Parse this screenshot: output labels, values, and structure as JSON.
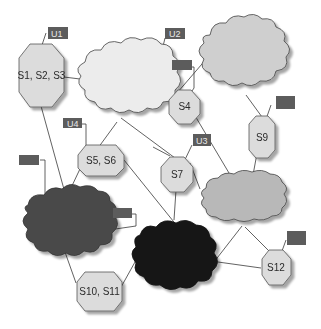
{
  "diagram": {
    "colors": {
      "background": "#ffffff",
      "octagon_fill": "#dcdcdc",
      "octagon_stroke": "#555555",
      "tag_fill": "#5c5c5c",
      "line": "#3a3a3a",
      "cloud_light": "#ececec",
      "cloud_midlight": "#cfcfcf",
      "cloud_mid": "#b8b8b8",
      "cloud_dark": "#4a4a4a",
      "cloud_black": "#151515"
    },
    "nodes": [
      {
        "id": "s1s2s3",
        "label": "S1, S2, S3"
      },
      {
        "id": "s4",
        "label": "S4"
      },
      {
        "id": "s5s6",
        "label": "S5, S6"
      },
      {
        "id": "s7",
        "label": "S7"
      },
      {
        "id": "s9",
        "label": "S9"
      },
      {
        "id": "s10s11",
        "label": "S10, S11"
      },
      {
        "id": "s12",
        "label": "S12"
      }
    ],
    "tags": [
      {
        "id": "u1",
        "label": "U1"
      },
      {
        "id": "u2",
        "label": "U2"
      },
      {
        "id": "u3",
        "label": "U3"
      },
      {
        "id": "u4",
        "label": "U4"
      },
      {
        "id": "blank1",
        "label": ""
      },
      {
        "id": "blank2",
        "label": ""
      },
      {
        "id": "blank3",
        "label": ""
      },
      {
        "id": "blank4",
        "label": ""
      },
      {
        "id": "blank5",
        "label": ""
      }
    ],
    "clouds": [
      {
        "id": "cloud-top-center",
        "shade": "light"
      },
      {
        "id": "cloud-top-right",
        "shade": "midlight"
      },
      {
        "id": "cloud-right-middle",
        "shade": "mid"
      },
      {
        "id": "cloud-bottom-left",
        "shade": "dark"
      },
      {
        "id": "cloud-bottom-center",
        "shade": "black"
      }
    ]
  }
}
